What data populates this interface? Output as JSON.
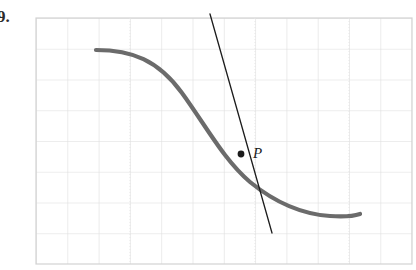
{
  "figure": {
    "problem_number": "9.",
    "background_color": "#ffffff",
    "grid": {
      "line_color": "#dcdcdc",
      "border_color": "#d2d2d2",
      "left": 36,
      "top": 18,
      "right": 412,
      "bottom": 264,
      "cell_width": 31.3,
      "cell_height": 30.75,
      "columns": 12,
      "rows": 8
    },
    "curve": {
      "name": "function-curve",
      "color": "#6b6b6b",
      "stroke_width": 4.2,
      "description": "decreasing sigmoid curve",
      "path": "M 96,50 C 132,50 158,60 182,93 C 206,126 224,160 250,182 C 272,200 300,214 330,216 C 344,217 354,216 360,214",
      "start_point": [
        96,
        50
      ],
      "end_point": [
        360,
        214
      ]
    },
    "tangent_line": {
      "name": "tangent-line",
      "color": "#1c1c1c",
      "stroke_width": 1.3,
      "x1": 210,
      "y1": 14,
      "x2": 272,
      "y2": 233
    },
    "point": {
      "name": "point-p",
      "label": "P",
      "x": 241,
      "y": 154,
      "radius": 3.4,
      "color": "#1c1c1c",
      "label_x": 253,
      "label_y": 158
    }
  }
}
